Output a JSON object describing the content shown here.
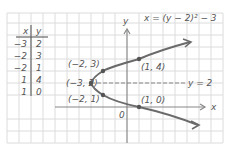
{
  "table": {
    "headers": [
      "x",
      "y"
    ],
    "rows": [
      {
        "x": "−3",
        "y": "2"
      },
      {
        "x": "−2",
        "y": "3"
      },
      {
        "x": "−2",
        "y": "1"
      },
      {
        "x": "1",
        "y": "4"
      },
      {
        "x": "1",
        "y": "0"
      }
    ]
  },
  "axes": {
    "x_label": "x",
    "y_label": "y",
    "origin_label": "0"
  },
  "equation": "x = (y − 2)² − 3",
  "axis_of_symmetry": "y = 2",
  "points": [
    {
      "label": "(−3, 2)",
      "x": -3,
      "y": 2
    },
    {
      "label": "(−2, 3)",
      "x": -2,
      "y": 3
    },
    {
      "label": "(−2, 1)",
      "x": -2,
      "y": 1
    },
    {
      "label": "(1, 4)",
      "x": 1,
      "y": 4
    },
    {
      "label": "(1, 0)",
      "x": 1,
      "y": 0
    }
  ],
  "colors": {
    "grid": "#dcdcdc",
    "curve": "#6a6a6a",
    "axis": "#888888",
    "text": "#555555"
  }
}
